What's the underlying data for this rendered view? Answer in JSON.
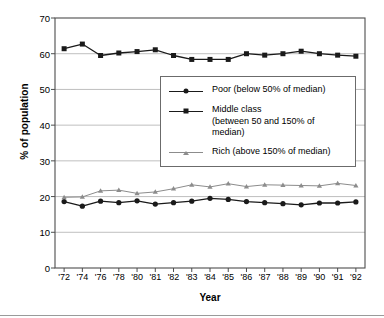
{
  "chart_data": {
    "type": "line",
    "title": "",
    "xlabel": "Year",
    "ylabel": "% of population",
    "categories": [
      "'72",
      "'74",
      "'76",
      "'78",
      "'80",
      "'81",
      "'82",
      "'83",
      "'84",
      "'85",
      "'86",
      "'87",
      "'88",
      "'89",
      "'90",
      "'91",
      "'92"
    ],
    "ylim": [
      0,
      70
    ],
    "yticks": [
      0,
      10,
      20,
      30,
      40,
      50,
      60,
      70
    ],
    "grid": "horizontal",
    "legend_position": "center",
    "series": [
      {
        "name": "Poor (below 50% of median)",
        "marker": "circle",
        "color": "#1a1a1a",
        "values": [
          18.6,
          17.3,
          18.7,
          18.3,
          18.8,
          17.9,
          18.3,
          18.7,
          19.5,
          19.2,
          18.6,
          18.3,
          18.0,
          17.7,
          18.2,
          18.2,
          18.5
        ]
      },
      {
        "name": "Middle class",
        "name_line2": "(between 50 and 150% of median)",
        "marker": "square",
        "color": "#1a1a1a",
        "values": [
          61.4,
          62.7,
          59.5,
          60.2,
          60.6,
          61.1,
          59.5,
          58.4,
          58.4,
          58.4,
          60.0,
          59.6,
          60.0,
          60.7,
          60.0,
          59.6,
          59.3
        ]
      },
      {
        "name": "Rich (above 150% of median)",
        "marker": "triangle",
        "color": "#8c8c8c",
        "values": [
          19.8,
          19.9,
          21.6,
          21.8,
          20.9,
          21.3,
          22.2,
          23.3,
          22.7,
          23.6,
          22.8,
          23.3,
          23.2,
          23.1,
          23.0,
          23.7,
          23.1
        ]
      }
    ]
  },
  "legend": {
    "items": [
      {
        "label": "Poor (below 50% of median)",
        "label2": "",
        "icon": "circle-marker-icon"
      },
      {
        "label": "Middle class",
        "label2": "(between 50 and 150% of median)",
        "icon": "square-marker-icon"
      },
      {
        "label": "Rich (above 150% of median)",
        "label2": "",
        "icon": "triangle-marker-icon"
      }
    ]
  },
  "colors": {
    "dark_series": "#1a1a1a",
    "light_series": "#8c8c8c",
    "grid": "#b8b8b8",
    "axis": "#4d4d4d"
  }
}
